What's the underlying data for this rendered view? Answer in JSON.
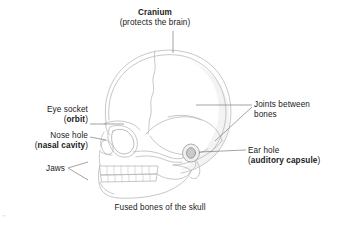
{
  "figure": {
    "caption": "Fused bones of the skull",
    "background_color": "#ffffff",
    "line_color": "#b4b4b4",
    "leader_color": "#777777",
    "text_color": "#1a1a1a"
  },
  "title": {
    "term": "Cranium",
    "note": "(protects the brain)"
  },
  "labels": {
    "eye_socket": {
      "line1": "Eye socket",
      "open_paren": "(",
      "term": "orbit",
      "close_paren": ")"
    },
    "nose_hole": {
      "line1": "Nose hole",
      "open_paren": "(",
      "term": "nasal cavity",
      "close_paren": ")"
    },
    "jaws": {
      "line1": "Jaws"
    },
    "joints": {
      "line1": "Joints between",
      "line2": "bones"
    },
    "ear_hole": {
      "line1": "Ear hole",
      "open_paren": "(",
      "term": "auditory capsule",
      "close_paren": ")"
    }
  },
  "artifact": {
    "mark": "\""
  }
}
